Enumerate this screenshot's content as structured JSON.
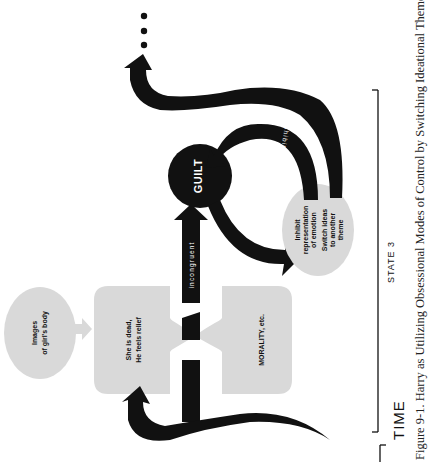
{
  "figure": {
    "orientation": "rotated-90-ccw",
    "caption": "Figure 9-1.  Harry as Utilizing Obsessional Modes of Control by Switching Ideational Themes",
    "time_label": "TIME",
    "state_label": "STATE 3",
    "continuation": "…"
  },
  "nodes": {
    "images": {
      "line1": "Images",
      "line2": "of girl's body"
    },
    "relief": {
      "line1": "She is dead,",
      "line2": "He feels relief"
    },
    "morality": {
      "line1": "MORALITY, etc."
    },
    "guilt": {
      "label": "GUILT"
    },
    "defense": {
      "line1": "Inhibit",
      "line2": "representation",
      "line3": "of emotion",
      "line4": "Switch ideas",
      "line5": "to another",
      "line6": "theme"
    }
  },
  "edges": {
    "incongruent": "incongruent",
    "inhibits": "inhibits"
  },
  "colors": {
    "ink": "#111111",
    "node_fill": "#d9d9d9",
    "background": "#ffffff"
  }
}
